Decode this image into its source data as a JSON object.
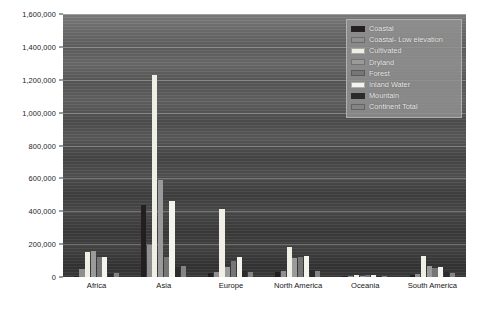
{
  "chart_data": {
    "type": "bar",
    "title": "",
    "xlabel": "",
    "ylabel": "",
    "ylim": [
      0,
      1600000
    ],
    "ytick_values": [
      0,
      200000,
      400000,
      600000,
      800000,
      1000000,
      1200000,
      1400000,
      1600000
    ],
    "ytick_labels": [
      "0",
      "200,000",
      "400,000",
      "600,000",
      "800,000",
      "1,000,000",
      "1,200,000",
      "1,400,000",
      "1,600,000"
    ],
    "grid": true,
    "legend_position": "top-right",
    "categories": [
      "Africa",
      "Asia",
      "Europe",
      "North America",
      "Oceania",
      "South America"
    ],
    "series": [
      {
        "name": "Coastal",
        "color": "#231f20",
        "values": [
          6000,
          440000,
          22000,
          30000,
          7000,
          12000
        ]
      },
      {
        "name": "Coastal- Low elevation",
        "color": "#8f8f8f",
        "values": [
          48000,
          195000,
          30000,
          35000,
          8000,
          18000
        ]
      },
      {
        "name": "Cultivated",
        "color": "#efefe6",
        "values": [
          150000,
          1230000,
          415000,
          180000,
          14000,
          125000
        ]
      },
      {
        "name": "Dryland",
        "color": "#9a9a9a",
        "values": [
          160000,
          590000,
          62000,
          118000,
          9000,
          70000
        ]
      },
      {
        "name": "Forest",
        "color": "#767676",
        "values": [
          120000,
          120000,
          95000,
          120000,
          11000,
          55000
        ]
      },
      {
        "name": "Inland Water",
        "color": "#f4f4ef",
        "values": [
          120000,
          460000,
          120000,
          125000,
          10000,
          58000
        ]
      },
      {
        "name": "Mountain",
        "color": "#2b2b2b",
        "values": [
          18000,
          60000,
          38000,
          42000,
          5000,
          30000
        ]
      },
      {
        "name": "Continent Total",
        "color": "#848484",
        "values": [
          22000,
          70000,
          30000,
          35000,
          6000,
          24000
        ]
      }
    ]
  },
  "legend": {
    "items": [
      {
        "label": "Coastal",
        "color": "#231f20"
      },
      {
        "label": "Coastal- Low elevation",
        "color": "#8f8f8f"
      },
      {
        "label": "Cultivated",
        "color": "#efefe6"
      },
      {
        "label": "Dryland",
        "color": "#9a9a9a"
      },
      {
        "label": "Forest",
        "color": "#767676"
      },
      {
        "label": "Inland Water",
        "color": "#f4f4ef"
      },
      {
        "label": "Mountain",
        "color": "#2b2b2b"
      },
      {
        "label": "Continent Total",
        "color": "#848484"
      }
    ]
  },
  "colors": {
    "plot_background": "#4e4e4e",
    "page_background": "#ffffff",
    "gridline": "#d7d7d7",
    "axis_text": "#1c1c1c",
    "legend_background": "#929292"
  }
}
